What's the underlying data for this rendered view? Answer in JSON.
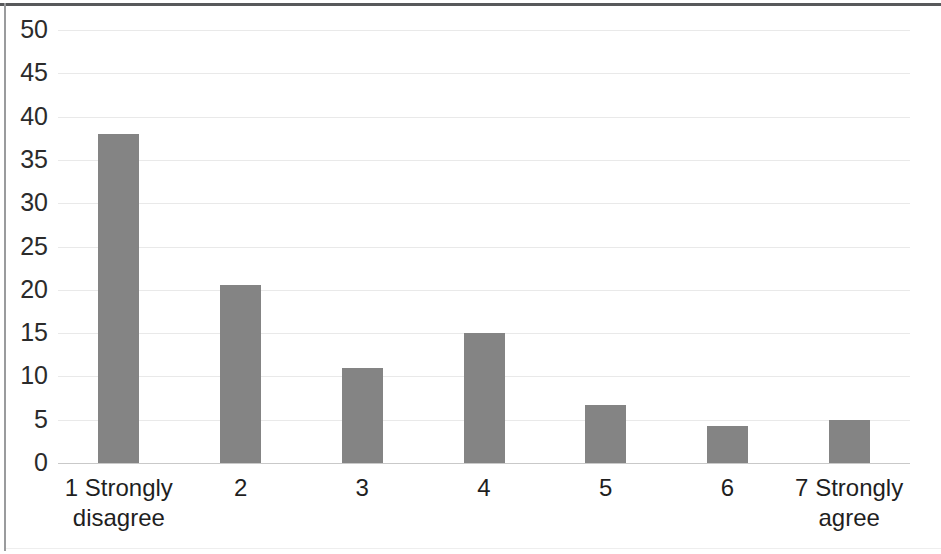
{
  "chart_data": {
    "type": "bar",
    "title": "",
    "subtitle": "",
    "xlabel": "",
    "ylabel": "",
    "categories": [
      "1 Strongly disagree",
      "2",
      "3",
      "4",
      "5",
      "6",
      "7 Strongly agree"
    ],
    "category_lines": [
      [
        "1 Strongly",
        "disagree"
      ],
      [
        "2"
      ],
      [
        "3"
      ],
      [
        "4"
      ],
      [
        "5"
      ],
      [
        "6"
      ],
      [
        "7 Strongly",
        "agree"
      ]
    ],
    "values": [
      38,
      20.5,
      11,
      15,
      6.7,
      4.3,
      5
    ],
    "series": [
      {
        "name": "Responses",
        "values": [
          38,
          20.5,
          11,
          15,
          6.7,
          4.3,
          5
        ]
      }
    ],
    "ylim": [
      0,
      50
    ],
    "yticks": [
      0,
      5,
      10,
      15,
      20,
      25,
      30,
      35,
      40,
      45,
      50
    ],
    "ytick_labels": [
      "0",
      "5",
      "10",
      "15",
      "20",
      "25",
      "30",
      "35",
      "40",
      "45",
      "50"
    ],
    "grid": true,
    "grid_axis": "y",
    "legend": false,
    "legend_position": "none",
    "bar_color": "#848484",
    "grid_color": "#e9e9e9",
    "axis_color": "#c9c9c9",
    "text_color": "#1f1f1f",
    "background": "#ffffff"
  }
}
